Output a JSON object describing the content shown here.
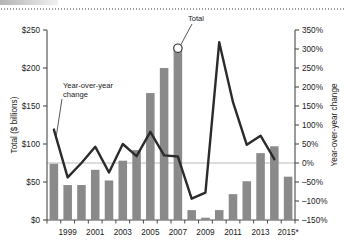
{
  "chart_data": {
    "type": "bar",
    "title": "",
    "subtitle": "",
    "xlabel": "",
    "ylabel": "Total ($ billions)",
    "y2label": "Year-over-year change",
    "grid": false,
    "legend_position": "none",
    "categories": [
      "1998",
      "1999",
      "2000",
      "2001",
      "2002",
      "2003",
      "2004",
      "2005",
      "2006",
      "2007",
      "2008",
      "2009",
      "2010",
      "2011",
      "2012",
      "2013",
      "2014",
      "2015*"
    ],
    "x_tick_labels": [
      "1999",
      "2001",
      "2003",
      "2005",
      "2007",
      "2009",
      "2011",
      "2013",
      "2015*"
    ],
    "x_tick_categories": [
      "1999",
      "2001",
      "2003",
      "2005",
      "2007",
      "2009",
      "2011",
      "2013",
      "2015*"
    ],
    "ylim": [
      0,
      250
    ],
    "y_ticks": [
      0,
      50,
      100,
      150,
      200,
      250
    ],
    "y_tick_labels": [
      "$0",
      "$50",
      "$100",
      "$150",
      "$200",
      "$250"
    ],
    "y2lim": [
      -150,
      350
    ],
    "y2_ticks": [
      -150,
      -100,
      -50,
      0,
      50,
      100,
      150,
      200,
      250,
      300,
      350
    ],
    "y2_tick_labels": [
      "-150%",
      "-100%",
      "-50%",
      "0%",
      "50%",
      "100%",
      "150%",
      "200%",
      "250%",
      "300%",
      "350%"
    ],
    "series": [
      {
        "name": "Total",
        "type": "bar",
        "axis": "left",
        "unit": "$ billions",
        "color": "#8a8a8a",
        "values": [
          74,
          46,
          46,
          66,
          52,
          78,
          92,
          167,
          200,
          228,
          13,
          3,
          13,
          34,
          51,
          88,
          97,
          57
        ]
      },
      {
        "name": "Year-over-year change",
        "type": "line",
        "axis": "right",
        "unit": "%",
        "color": "#2b2b2b",
        "values": [
          88,
          -38,
          0,
          43,
          -25,
          50,
          18,
          82,
          20,
          17,
          -94,
          -78,
          318,
          160,
          48,
          72,
          10,
          null
        ]
      }
    ],
    "annotations": [
      {
        "text": "Total",
        "target_category": "2007",
        "target_series": "Total"
      },
      {
        "text": "Year-over-year change",
        "target_category": "1998",
        "target_series": "Year-over-year change"
      }
    ]
  },
  "axes": {
    "left_title": "Total ($ billions)",
    "right_title": "Year-over-year change",
    "left_ticks": [
      "$250",
      "$200",
      "$150",
      "$100",
      "$50",
      "$0"
    ],
    "right_ticks": [
      "350%",
      "300%",
      "250%",
      "200%",
      "150%",
      "100%",
      "50%",
      "0%",
      "-50%",
      "-100%",
      "-150%"
    ],
    "x_ticks": [
      "1999",
      "2001",
      "2003",
      "2005",
      "2007",
      "2009",
      "2011",
      "2013",
      "2015*"
    ]
  },
  "annotations": {
    "total_label": "Total",
    "yoy_label_line1": "Year-over-year",
    "yoy_label_line2": "change"
  },
  "colors": {
    "bar": "#8a8a8a",
    "line": "#2b2b2b",
    "axis": "#4a4a4a",
    "zero_line": "#b5b5b5",
    "text": "#1a1a1a"
  }
}
